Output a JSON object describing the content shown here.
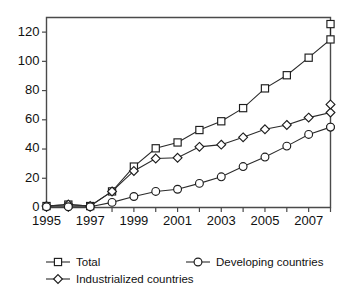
{
  "chart_data": {
    "type": "line",
    "title": "",
    "subtitle": "",
    "xlabel": "",
    "ylabel": "",
    "x": [
      1995,
      1996,
      1997,
      1998,
      1999,
      2000,
      2001,
      2002,
      2003,
      2004,
      2005,
      2006,
      2007,
      2008
    ],
    "xlim": [
      1995,
      2008
    ],
    "ylim": [
      0,
      130
    ],
    "yticks": [
      0,
      20,
      40,
      60,
      80,
      100,
      120
    ],
    "ytick_labels": [
      "0",
      "20",
      "40",
      "60",
      "80",
      "100",
      "120"
    ],
    "xticks": [
      1995,
      1996,
      1997,
      1998,
      1999,
      2000,
      2001,
      2002,
      2003,
      2004,
      2005,
      2006,
      2007,
      2008
    ],
    "xtick_labels": [
      "1995",
      "",
      "1997",
      "",
      "1999",
      "",
      "2001",
      "",
      "2003",
      "",
      "2005",
      "",
      "2007",
      ""
    ],
    "grid": false,
    "legend_position": "bottom",
    "series": [
      {
        "name": "Total",
        "marker": "square",
        "values": [
          1,
          2,
          1,
          11,
          28,
          40.5,
          44.5,
          53,
          59,
          68,
          81.5,
          90.5,
          102.5,
          115
        ]
      },
      {
        "name": "Industrialized countries",
        "marker": "diamond",
        "values": [
          1,
          2,
          1,
          11,
          25,
          33.5,
          34,
          41.5,
          43,
          48,
          53.5,
          56.5,
          61.5,
          65
        ]
      },
      {
        "name": "Developing countries",
        "marker": "circle",
        "values": [
          0.5,
          0.5,
          0.5,
          3.5,
          7.5,
          11,
          12.5,
          16.5,
          21,
          28,
          34.5,
          42,
          50,
          55
        ]
      }
    ],
    "final_points": {
      "Total": 125.5,
      "Industrialized countries": 70.5,
      "Developing countries": 55
    },
    "colors": {
      "line": "#2b2b2b",
      "marker_fill": "#ffffff",
      "marker_stroke": "#1d1d1d",
      "axis": "#4a4a4a",
      "background": "#ffffff"
    }
  },
  "legend": {
    "items": [
      {
        "label": "Total",
        "marker": "square"
      },
      {
        "label": "Developing countries",
        "marker": "circle"
      },
      {
        "label": "Industrialized countries",
        "marker": "diamond"
      }
    ]
  }
}
